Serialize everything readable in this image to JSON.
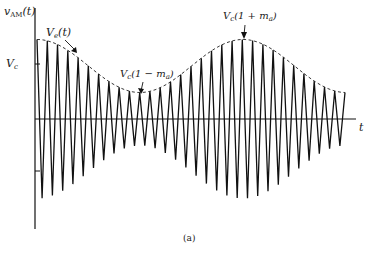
{
  "figure": {
    "caption": "(a)",
    "y_axis_label": {
      "main": "v",
      "sub": "AM",
      "arg": "(t)"
    },
    "x_axis_label": "t",
    "tick_label_vc": {
      "main": "V",
      "sub": "c"
    },
    "annotations": {
      "envelope": {
        "main": "V",
        "sub": "e",
        "rest": "(t)"
      },
      "minimum": {
        "main": "V",
        "sub": "c",
        "rest": "(1 − m",
        "sub2": "a",
        "close": ")"
      },
      "maximum": {
        "main": "V",
        "sub": "c",
        "rest": "(1 + m",
        "sub2": "a",
        "close": ")"
      }
    }
  },
  "chart_data": {
    "type": "line",
    "title": "",
    "xlabel": "t",
    "ylabel": "v_AM(t)",
    "annotations": [
      "V_e(t)",
      "V_c(1 − m_a)",
      "V_c(1 + m_a)",
      "V_c"
    ],
    "carrier_cycles_visible": 30,
    "envelope": {
      "form": "V_c(1 + m_a cos(ω_m t + φ))",
      "start_relative": 1.45,
      "minimum_relative": 0.5,
      "maximum_relative": 1.5,
      "end_relative": 0.5
    },
    "series": [
      {
        "name": "v_AM(t)",
        "style": "solid"
      },
      {
        "name": "V_e(t)",
        "style": "dashed"
      }
    ],
    "grid": false,
    "legend": "none"
  }
}
